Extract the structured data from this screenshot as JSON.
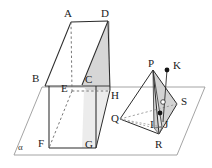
{
  "figure": {
    "caption": "",
    "width": 212,
    "height": 168,
    "background_color": "#ffffff",
    "stroke_color": "#2b2b2b",
    "light_stroke_color": "#8d8d8d",
    "shade_fill": "#d4d4d4",
    "shade_fill_light": "#bdbdbd",
    "dash_color": "#6f6f6f"
  },
  "plane": {
    "name_label": "α",
    "label_x": 18,
    "label_y": 143,
    "corners": [
      [
        14,
        155
      ],
      [
        42,
        87
      ],
      [
        205,
        87
      ],
      [
        177,
        155
      ]
    ]
  },
  "prism": {
    "labels": [
      {
        "id": "A",
        "text": "A",
        "x": 64,
        "y": 8
      },
      {
        "id": "D",
        "text": "D",
        "x": 101,
        "y": 8
      },
      {
        "id": "B",
        "text": "B",
        "x": 32,
        "y": 73
      },
      {
        "id": "C",
        "text": "C",
        "x": 85,
        "y": 74
      },
      {
        "id": "E",
        "text": "E",
        "x": 61,
        "y": 83
      },
      {
        "id": "H",
        "text": "H",
        "x": 111,
        "y": 90
      },
      {
        "id": "F",
        "text": "F",
        "x": 38,
        "y": 138
      },
      {
        "id": "G",
        "text": "G",
        "x": 85,
        "y": 139
      }
    ],
    "vertices": {
      "A": [
        71,
        22
      ],
      "D": [
        108,
        21
      ],
      "B": [
        45,
        86
      ],
      "C": [
        82,
        85
      ],
      "E": [
        72,
        91
      ],
      "H": [
        110,
        90
      ],
      "F": [
        49,
        148
      ],
      "G": [
        96,
        148
      ]
    }
  },
  "pyramid": {
    "labels": [
      {
        "id": "P",
        "text": "P",
        "x": 148,
        "y": 58
      },
      {
        "id": "K",
        "text": "K",
        "x": 173,
        "y": 60
      },
      {
        "id": "S",
        "text": "S",
        "x": 181,
        "y": 96
      },
      {
        "id": "Q",
        "text": "Q",
        "x": 111,
        "y": 113
      },
      {
        "id": "I",
        "text": "I",
        "x": 150,
        "y": 119
      },
      {
        "id": "J",
        "text": "J",
        "x": 164,
        "y": 119
      },
      {
        "id": "R",
        "text": "R",
        "x": 155,
        "y": 139
      }
    ],
    "vertices": {
      "P": [
        153,
        70
      ],
      "K": [
        167,
        70
      ],
      "S": [
        177,
        104
      ],
      "Q": [
        120,
        119
      ],
      "I": [
        154,
        128
      ],
      "J": [
        162,
        127
      ],
      "R": [
        159,
        134
      ]
    },
    "points": [
      {
        "id": "K-dot",
        "x": 167,
        "y": 70,
        "r": 2.4,
        "fill": "#141414"
      },
      {
        "id": "interior-dot",
        "x": 160,
        "y": 113,
        "r": 2.4,
        "fill": "#141414"
      },
      {
        "id": "open-dot",
        "x": 163,
        "y": 102,
        "r": 2.4,
        "fill": "#ffffff"
      }
    ]
  }
}
